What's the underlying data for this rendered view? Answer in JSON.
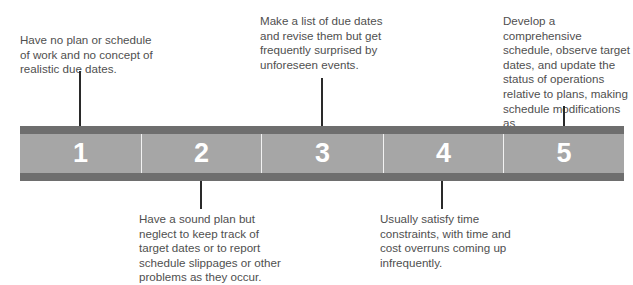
{
  "diagram": {
    "type": "maturity-scale",
    "levels": [
      {
        "number": "1",
        "description": "Have no plan or schedule of work and no concept of realistic due dates.",
        "position": "above"
      },
      {
        "number": "2",
        "description": "Have a sound plan but neglect to keep track of target dates or to report schedule slippages or other problems as they occur.",
        "position": "below"
      },
      {
        "number": "3",
        "description": "Make a list of due dates and revise them but get frequently surprised by unforeseen events.",
        "position": "above"
      },
      {
        "number": "4",
        "description": "Usually satisfy time constraints, with time and cost overruns coming up infrequently.",
        "position": "below"
      },
      {
        "number": "5",
        "description": "Develop a comprehensive schedule, observe target dates, and update the status of operations relative to plans, making schedule modifications as quickly as necessary.",
        "position": "above"
      }
    ],
    "lines": {
      "l1": [
        "Have no plan or schedule",
        "of work and no concept of",
        "realistic due dates."
      ],
      "l2": [
        "Have a sound plan but",
        "neglect to keep track of",
        "target dates or to report",
        "schedule slippages or other",
        "problems as they occur."
      ],
      "l3": [
        "Make a list of due dates",
        "and revise them but get",
        "frequently surprised by",
        "unforeseen events."
      ],
      "l4": [
        "Usually satisfy time",
        "constraints, with time and",
        "cost overruns coming up",
        "infrequently."
      ],
      "l5": [
        "Develop a comprehensive",
        "schedule, observe target",
        "dates, and update the",
        "status of operations",
        "relative to plans, making",
        "schedule modifications as",
        "quickly as necessary."
      ]
    },
    "colors": {
      "band_dark": "#6e6e6e",
      "band_light": "#a6a6a6",
      "number_text": "#ffffff",
      "divider": "#f2f2f2"
    }
  }
}
